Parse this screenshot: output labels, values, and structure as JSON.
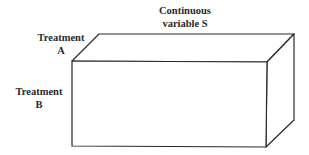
{
  "diagram": {
    "type": "3d-box",
    "colors": {
      "stroke": "#2a2a2a",
      "fill": "#ffffff",
      "text": "#2a2a2a"
    },
    "labels": {
      "continuous_variable": {
        "line1": "Continuous",
        "line2": "variable S"
      },
      "treatment_a": {
        "line1": "Treatment",
        "line2": "A"
      },
      "treatment_b": {
        "line1": "Treatment",
        "line2": "B"
      }
    },
    "box": {
      "front_face": {
        "x1": 72,
        "y1": 61,
        "x2": 267,
        "y2": 147
      },
      "depth_offset": {
        "dx": 27,
        "dy": -27
      }
    }
  }
}
